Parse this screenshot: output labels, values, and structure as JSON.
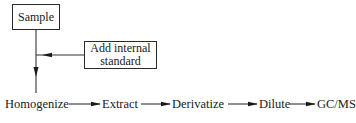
{
  "diagram": {
    "type": "flowchart",
    "nodes": {
      "sample": {
        "label": "Sample",
        "shape": "box"
      },
      "internal_standard": {
        "label": "Add internal standard",
        "line1": "Add internal",
        "line2": "standard",
        "shape": "box"
      },
      "homogenize": {
        "label": "Homogenize",
        "shape": "text"
      },
      "extract": {
        "label": "Extract",
        "shape": "text"
      },
      "derivatize": {
        "label": "Derivatize",
        "shape": "text"
      },
      "dilute": {
        "label": "Dilute",
        "shape": "text"
      },
      "gcms": {
        "label": "GC/MS",
        "shape": "text"
      }
    },
    "edges": [
      {
        "from": "Sample",
        "to": "Homogenize"
      },
      {
        "from": "Add internal standard",
        "to": "Sample→Homogenize line"
      },
      {
        "from": "Homogenize",
        "to": "Extract"
      },
      {
        "from": "Extract",
        "to": "Derivatize"
      },
      {
        "from": "Derivatize",
        "to": "Dilute"
      },
      {
        "from": "Dilute",
        "to": "GC/MS"
      }
    ],
    "colors": {
      "stroke": "#2a2a2a",
      "background": "#ffffff"
    }
  }
}
